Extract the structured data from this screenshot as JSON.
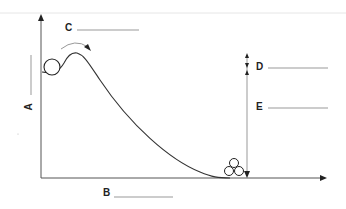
{
  "diagram": {
    "labels": {
      "A": "A",
      "B": "B",
      "C": "C",
      "D": "D",
      "E": "E"
    },
    "colors": {
      "line": "#333333",
      "blank": "#999999",
      "background": "#ffffff"
    }
  }
}
